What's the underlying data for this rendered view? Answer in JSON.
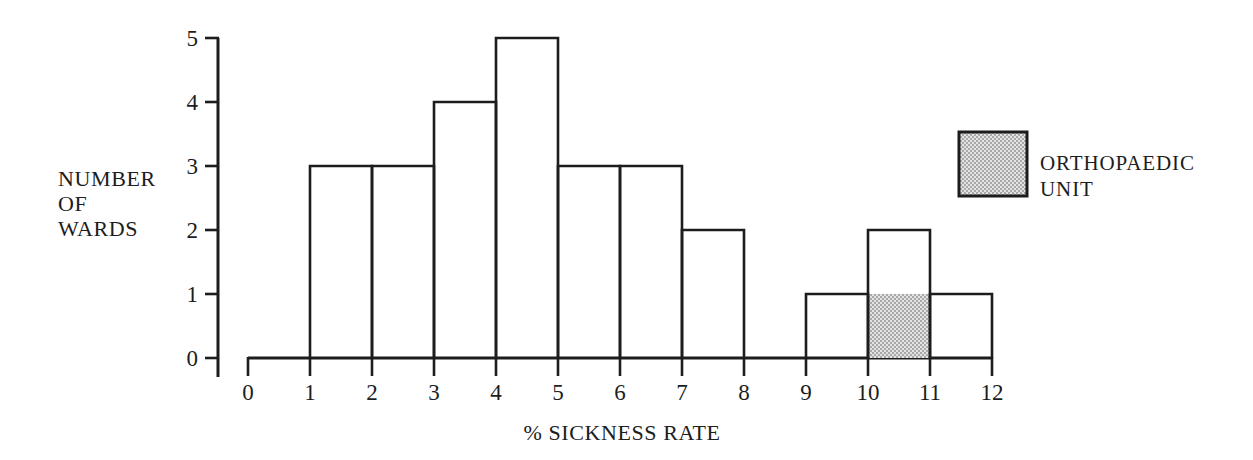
{
  "chart_data": {
    "type": "bar",
    "title": "",
    "subtitle": "",
    "xlabel": "% SICKNESS RATE",
    "ylabel": "NUMBER OF WARDS",
    "ylabel_lines": [
      "NUMBER",
      "OF",
      "WARDS"
    ],
    "categories": [
      "0-1",
      "1-2",
      "2-3",
      "3-4",
      "4-5",
      "5-6",
      "6-7",
      "7-8",
      "8-9",
      "9-10",
      "10-11",
      "11-12"
    ],
    "bin_edges": [
      0,
      1,
      2,
      3,
      4,
      5,
      6,
      7,
      8,
      9,
      10,
      11,
      12
    ],
    "values": [
      0,
      3,
      3,
      4,
      5,
      3,
      3,
      2,
      0,
      1,
      2,
      1
    ],
    "highlighted_bins": [
      {
        "bin": "10-11",
        "from": 0,
        "to": 1,
        "label": "ORTHOPAEDIC UNIT"
      }
    ],
    "xlim": [
      0,
      12
    ],
    "ylim": [
      0,
      5
    ],
    "xticks": [
      "0",
      "1",
      "2",
      "3",
      "4",
      "5",
      "6",
      "7",
      "8",
      "9",
      "10",
      "11",
      "12"
    ],
    "yticks": [
      "0",
      "1",
      "2",
      "3",
      "4",
      "5"
    ],
    "grid": false,
    "legend_position": "top-right",
    "bar_fill": "#ffffff",
    "bar_stroke": "#1d1d1d",
    "highlight_fill": "#c2c2c2"
  },
  "legend": {
    "items": [
      {
        "swatch_color": "#c2c2c2",
        "label_lines": [
          "ORTHOPAEDIC",
          "UNIT"
        ],
        "label": "ORTHOPAEDIC UNIT"
      }
    ]
  },
  "axes": {
    "x_title": "% SICKNESS RATE",
    "y_title_line1": "NUMBER",
    "y_title_line2": "OF",
    "y_title_line3": "WARDS",
    "x_tick_labels": [
      "0",
      "1",
      "2",
      "3",
      "4",
      "5",
      "6",
      "7",
      "8",
      "9",
      "10",
      "11",
      "12"
    ],
    "y_tick_labels": [
      "0",
      "1",
      "2",
      "3",
      "4",
      "5"
    ]
  }
}
